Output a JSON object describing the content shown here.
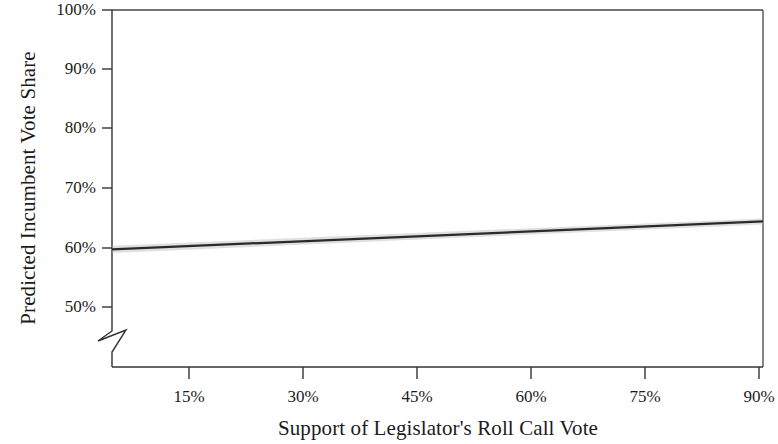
{
  "chart_data": {
    "type": "line",
    "title": "",
    "subtitle": "",
    "xlabel": "Support of Legislator's Roll Call Vote",
    "ylabel": "Predicted Incumbent Vote Share",
    "xlim": [
      7.5,
      90
    ],
    "ylim": [
      45,
      100
    ],
    "y_axis_break": true,
    "y_axis_break_note": "axis break (zigzag) drawn below the 50% tick",
    "grid": false,
    "legend": null,
    "xticks": [
      15,
      30,
      45,
      60,
      75,
      90
    ],
    "xtick_labels": [
      "15%",
      "30%",
      "45%",
      "60%",
      "75%",
      "90%"
    ],
    "yticks": [
      50,
      60,
      70,
      80,
      90,
      100
    ],
    "ytick_labels": [
      "50%",
      "60%",
      "70%",
      "80%",
      "90%",
      "100%"
    ],
    "series": [
      {
        "name": "Predicted incumbent vote share",
        "x": [
          7.5,
          90
        ],
        "values": [
          59.7,
          64.4
        ],
        "color": "#2a2a2a",
        "style": "solid-straight-line"
      },
      {
        "name": "95% confidence band",
        "x": [
          7.5,
          90
        ],
        "lower": [
          59.1,
          63.9
        ],
        "upper": [
          60.3,
          64.9
        ],
        "color": "#b8b8b8",
        "style": "shaded-band"
      }
    ],
    "annotations": []
  },
  "axes": {
    "y_title": "Predicted Incumbent Vote Share",
    "x_title": "Support of Legislator's Roll Call Vote",
    "y_labels": {
      "t100": "100%",
      "t90": "90%",
      "t80": "80%",
      "t70": "70%",
      "t60": "60%",
      "t50": "50%"
    },
    "x_labels": {
      "t15": "15%",
      "t30": "30%",
      "t45": "45%",
      "t60": "60%",
      "t75": "75%",
      "t90": "90%"
    }
  },
  "colors": {
    "background": "#ffffff",
    "axis": "#333333",
    "frame": "#444444",
    "line": "#2a2a2a",
    "band": "#b8b8b8",
    "text": "#1b1b1b"
  }
}
